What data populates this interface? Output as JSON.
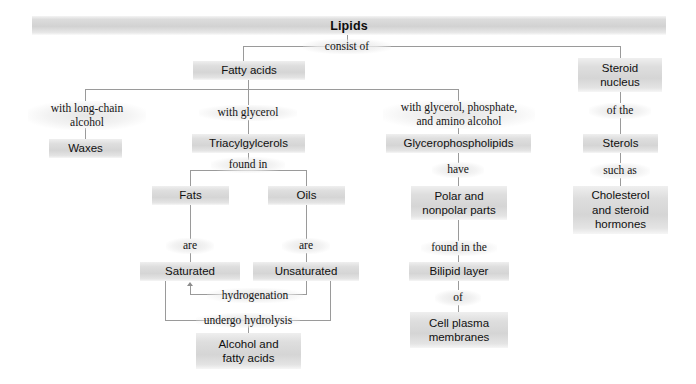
{
  "title": "Lipids",
  "nodes": {
    "lipids": "Lipids",
    "fatty_acids": "Fatty acids",
    "steroid_nucleus_l1": "Steroid",
    "steroid_nucleus_l2": "nucleus",
    "waxes": "Waxes",
    "triacylglycerols": "Triacylgylcerols",
    "glycerophospholipids": "Glycerophospholipids",
    "sterols": "Sterols",
    "fats": "Fats",
    "oils": "Oils",
    "polar_l1": "Polar and",
    "polar_l2": "nonpolar parts",
    "cholesterol_l1": "Cholesterol",
    "cholesterol_l2": "and steroid",
    "cholesterol_l3": "hormones",
    "saturated": "Saturated",
    "unsaturated": "Unsaturated",
    "bilipid_layer": "Bilipid layer",
    "cell_plasma_l1": "Cell plasma",
    "cell_plasma_l2": "membranes",
    "alcohol_l1": "Alcohol and",
    "alcohol_l2": "fatty acids"
  },
  "links": {
    "consist_of": "consist of",
    "with_long_chain_l1": "with long-chain",
    "with_long_chain_l2": "alcohol",
    "with_glycerol": "with glycerol",
    "with_glycerol_phosphate_l1": "with glycerol, phosphate,",
    "with_glycerol_phosphate_l2": "and amino alcohol",
    "of_the": "of the",
    "found_in": "found in",
    "have": "have",
    "such_as": "such as",
    "are_fats": "are",
    "are_oils": "are",
    "found_in_the": "found in the",
    "of": "of",
    "hydrogenation": "hydrogenation",
    "undergo_hydrolysis": "undergo hydrolysis"
  },
  "colors": {
    "node_fill": "#d5d5d5",
    "banner_fill": "#d2d2d2",
    "connector": "#9a9a9a",
    "text": "#101010",
    "background": "#ffffff"
  }
}
